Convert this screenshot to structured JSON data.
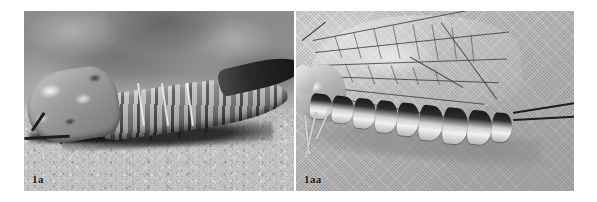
{
  "figure": {
    "panel_count": 2,
    "background_color": "#ffffff"
  },
  "panels": [
    {
      "id": "panel-a",
      "label": "1a",
      "position": "left",
      "subject": "mayfly nymph (larva) in lateral view resting on sand substrate",
      "palette": {
        "background": "#9a9a9a",
        "ground": "#bcbcbc",
        "body_light": "#c9c9c9",
        "body_dark": "#1d1d1d",
        "shadow": "#121212"
      },
      "features": [
        "blurred mottled grey background",
        "granular pale sand foreground",
        "dark cast shadow beneath body",
        "light mottled head and thorax",
        "banded tapering abdomen",
        "dark slender caudal filaments extending right",
        "six dark legs with shadows"
      ]
    },
    {
      "id": "panel-aa",
      "label": "1aa",
      "position": "right",
      "subject": "adult mayfly in lateral view clinging to a fine mesh screen",
      "palette": {
        "background": "#c4c4c4",
        "mesh": "#b6b6b6",
        "wing_membrane": "#eeeeee",
        "vein": "#3a3a3a",
        "segment_dark": "#1a1a1a",
        "segment_light": "#f2f2f2"
      },
      "features": [
        "fine woven mesh / screen backdrop",
        "transparent forewing with dark venation network",
        "cross-veins forming rectangular cells",
        "strongly banded black-and-white abdominal segments",
        "long slender dark cerci at rear",
        "pale legs held forward",
        "pale head and thorax at far left"
      ]
    }
  ],
  "labels": {
    "panel_a_label": "1a",
    "panel_aa_label": "1aa"
  }
}
